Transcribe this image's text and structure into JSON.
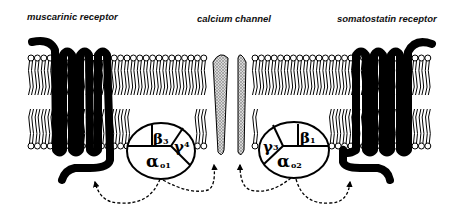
{
  "labels": {
    "left_receptor": "muscarinic receptor",
    "channel": "calcium channel",
    "right_receptor": "somatostatin receptor"
  },
  "left_g_protein": {
    "beta": {
      "symbol": "β",
      "subscript": "3"
    },
    "gamma": {
      "symbol": "γ",
      "subscript": "4"
    },
    "alpha": {
      "symbol": "α",
      "subscript": "o1"
    }
  },
  "right_g_protein": {
    "beta": {
      "symbol": "β",
      "subscript": "1"
    },
    "gamma": {
      "symbol": "γ",
      "subscript": "3"
    },
    "alpha": {
      "symbol": "α",
      "subscript": "o2"
    }
  },
  "colors": {
    "ink": "#000000",
    "channel_fill": "#b8b8b8",
    "background": "#ffffff"
  }
}
